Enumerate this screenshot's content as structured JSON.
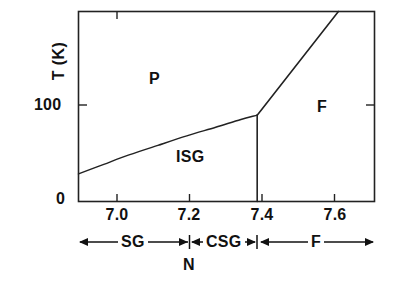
{
  "chart_data": {
    "type": "line",
    "title": "",
    "xlabel": "",
    "ylabel": "T (K)",
    "xlim": [
      6.88,
      7.7
    ],
    "ylim": [
      0,
      220
    ],
    "grid": false,
    "legend": null,
    "xticks": [
      "7.0",
      "7.2",
      "7.4",
      "7.6"
    ],
    "xtick_values": [
      7.0,
      7.2,
      7.4,
      7.6
    ],
    "yticks": [
      "0",
      "100"
    ],
    "ytick_values": [
      0,
      100
    ],
    "series": [
      {
        "name": "paramagnet-to-spin-glass boundary",
        "comment": "concave curve rising from left axis to the multicritical point",
        "points": [
          [
            6.88,
            32
          ],
          [
            6.95,
            43
          ],
          [
            7.02,
            54
          ],
          [
            7.1,
            65
          ],
          [
            7.18,
            76
          ],
          [
            7.26,
            86
          ],
          [
            7.33,
            95
          ],
          [
            7.375,
            100
          ]
        ]
      },
      {
        "name": "paramagnet-to-ferromagnet boundary",
        "comment": "straight line rising from the multicritical point to the top frame",
        "points": [
          [
            7.375,
            100
          ],
          [
            7.6,
            220
          ]
        ]
      },
      {
        "name": "ferromagnet-to-spin-glass boundary",
        "comment": "vertical line dropping from the multicritical point to T = 0",
        "points": [
          [
            7.375,
            100
          ],
          [
            7.375,
            0
          ]
        ]
      }
    ],
    "annotations": [
      {
        "text": "P",
        "x": 7.07,
        "y": 158,
        "name": "phase-label-p"
      },
      {
        "text": "ISG",
        "x": 7.18,
        "y": 48,
        "name": "phase-label-isg"
      },
      {
        "text": "F",
        "x": 7.55,
        "y": 92,
        "name": "phase-label-f"
      }
    ],
    "multicritical_point": {
      "x": 7.375,
      "y": 100
    }
  },
  "axis": {
    "ylabel": "T (K)",
    "ytick_0": "0",
    "ytick_100": "100",
    "xtick_70": "7.0",
    "xtick_72": "7.2",
    "xtick_74": "7.4",
    "xtick_76": "7.6"
  },
  "phases": {
    "p": "P",
    "isg": "ISG",
    "f": "F"
  },
  "bracket_row": {
    "segments": [
      {
        "label": "SG",
        "from": 6.88,
        "to": 7.19
      },
      {
        "label": "CSG",
        "from": 7.19,
        "to": 7.375
      },
      {
        "label": "F",
        "from": 7.375,
        "to": 7.7
      }
    ],
    "sg": "SG",
    "csg": "CSG",
    "f": "F",
    "n_label": "N"
  },
  "colors": {
    "background": "#ffffff",
    "ink": "#111111",
    "frame": "#222222"
  }
}
